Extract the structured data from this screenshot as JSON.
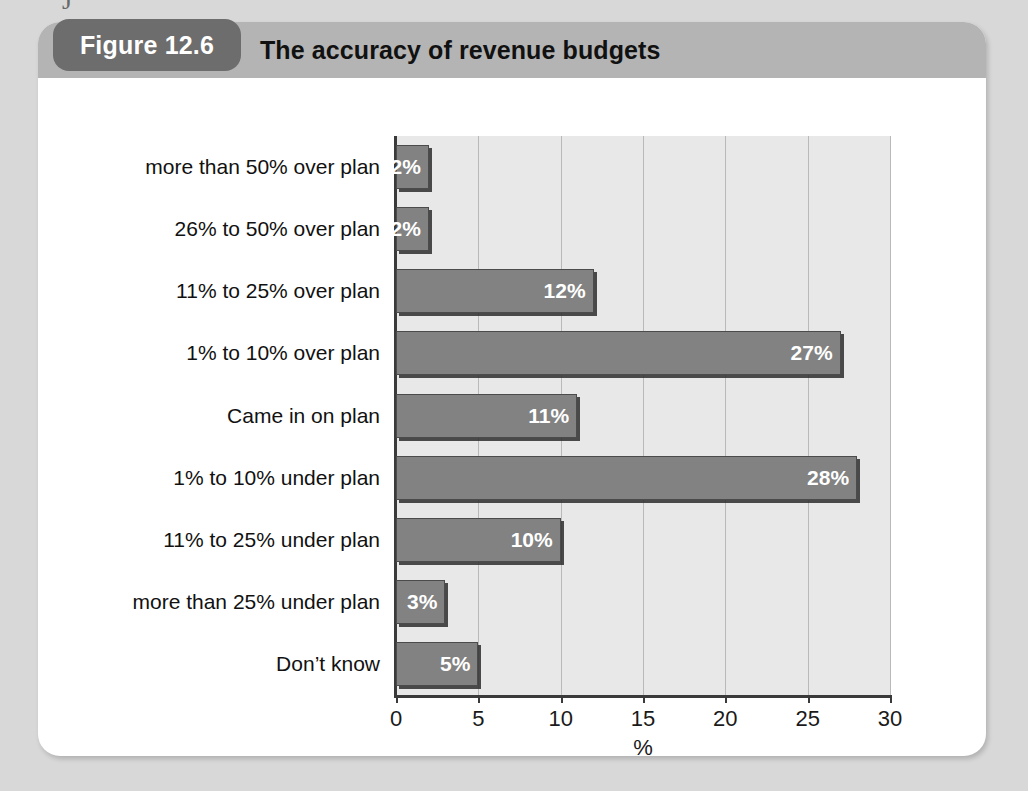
{
  "scan": {
    "top_remnant_glyph": "J"
  },
  "figure": {
    "badge_label": "Figure 12.6",
    "title": "The accuracy of revenue budgets"
  },
  "colors": {
    "page_background": "#d8d8d8",
    "card_background": "#ffffff",
    "header_bar": "#b4b4b4",
    "badge": "#6d6d6d",
    "plot_background": "#e8e8e8",
    "bar_fill": "#828282",
    "bar_outline": "#4b4b4b",
    "axis": "#3a3a3a",
    "gridline": "#b9b9b9",
    "value_label": "#ffffff"
  },
  "chart_data": {
    "type": "bar",
    "orientation": "horizontal",
    "title": "The accuracy of revenue budgets",
    "xlabel": "%",
    "ylabel": "",
    "xlim": [
      0,
      30
    ],
    "xticks": [
      0,
      5,
      10,
      15,
      20,
      25,
      30
    ],
    "xtick_labels": [
      "0",
      "5",
      "10",
      "15",
      "20",
      "25",
      "30"
    ],
    "grid": "vertical",
    "legend": "none",
    "categories": [
      "more than 50% over plan",
      "26% to 50% over plan",
      "11% to 25% over plan",
      "1% to 10% over plan",
      "Came in on plan",
      "1% to 10% under plan",
      "11% to 25% under plan",
      "more than 25% under plan",
      "Don’t know"
    ],
    "values": [
      2,
      2,
      12,
      27,
      11,
      28,
      10,
      3,
      5
    ],
    "data_labels": [
      "2%",
      "2%",
      "12%",
      "27%",
      "11%",
      "28%",
      "10%",
      "3%",
      "5%"
    ]
  }
}
